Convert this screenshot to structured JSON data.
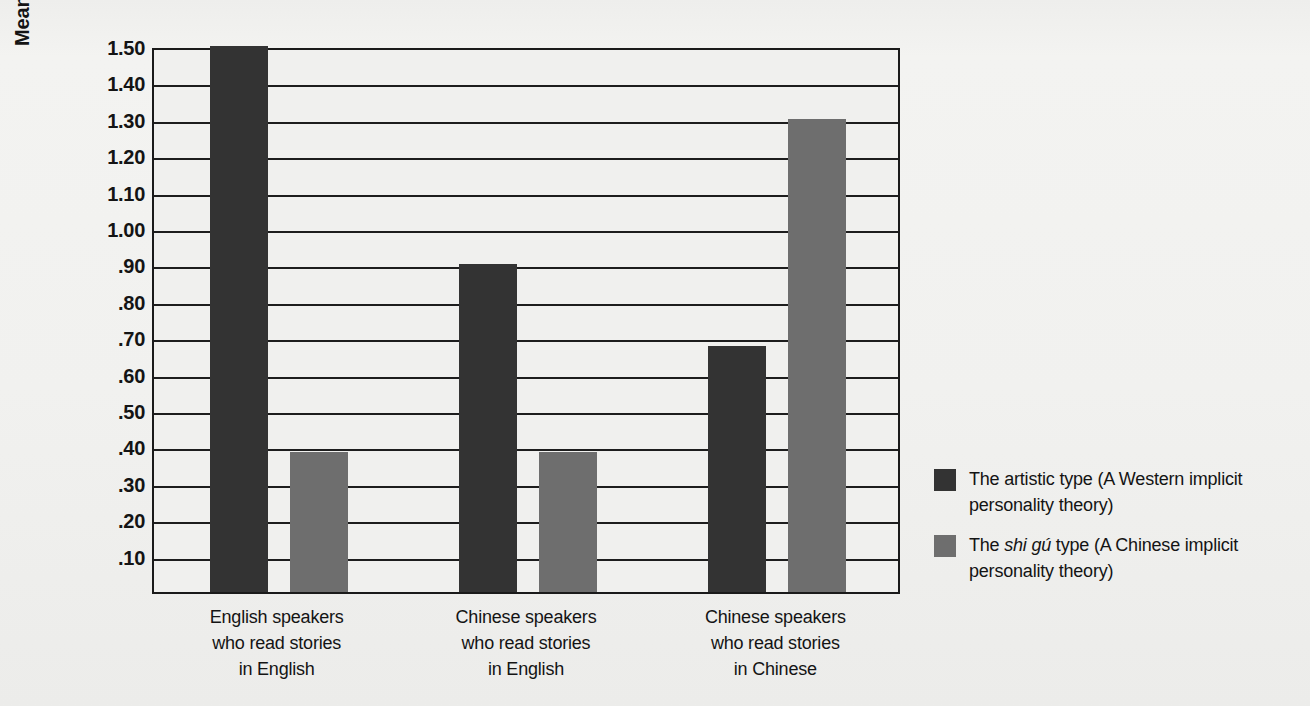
{
  "chart_data": {
    "type": "bar",
    "title": "",
    "xlabel": "",
    "ylabel": "Mean number of new schematic traits",
    "ylim": [
      0,
      1.5
    ],
    "grid": true,
    "legend_position": "right",
    "y_ticks": [
      "1.50",
      "1.40",
      "1.30",
      "1.20",
      "1.10",
      "1.00",
      ".90",
      ".80",
      ".70",
      ".60",
      ".50",
      ".40",
      ".30",
      ".20",
      ".10"
    ],
    "y_tick_values": [
      1.5,
      1.4,
      1.3,
      1.2,
      1.1,
      1.0,
      0.9,
      0.8,
      0.7,
      0.6,
      0.5,
      0.4,
      0.3,
      0.2,
      0.1
    ],
    "categories": [
      "English speakers\nwho read stories\nin English",
      "Chinese speakers\nwho read stories\nin English",
      "Chinese speakers\nwho read stories\nin Chinese"
    ],
    "category_lines": [
      [
        "English speakers",
        "who read stories",
        "in English"
      ],
      [
        "Chinese speakers",
        "who read stories",
        "in English"
      ],
      [
        "Chinese speakers",
        "who read stories",
        "in Chinese"
      ]
    ],
    "series": [
      {
        "name": "The artistic type (A Western implicit personality theory)",
        "color": "#333333",
        "values": [
          1.5,
          0.9,
          0.675
        ]
      },
      {
        "name": "The shi gú type (A Chinese implicit personality theory)",
        "color": "#6e6e6e",
        "values": [
          0.385,
          0.385,
          1.3
        ]
      }
    ]
  },
  "legend": {
    "items": [
      {
        "swatch": "dark",
        "prefix": "The artistic type (A Western implicit",
        "italic": "",
        "suffix": "",
        "line2": "personality theory)"
      },
      {
        "swatch": "light",
        "prefix": "The ",
        "italic": "shi gú",
        "suffix": " type (A Chinese implicit",
        "line2": "personality theory)"
      }
    ]
  },
  "colors": {
    "dark_bar": "#333333",
    "light_bar": "#6e6e6e",
    "axis": "#1a1a1a",
    "page_background": "#f1f1ef"
  }
}
